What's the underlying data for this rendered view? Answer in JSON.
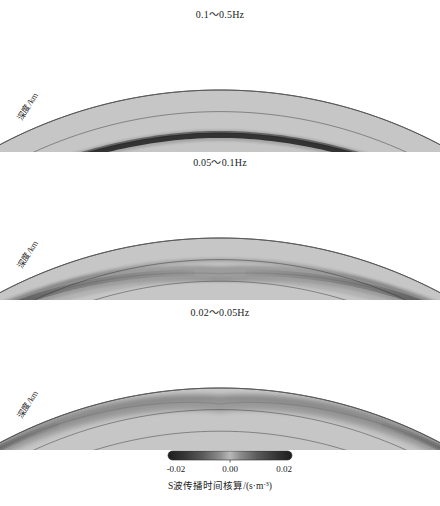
{
  "figure": {
    "background_color": "#ffffff",
    "section_fill": "#c6c6c6",
    "section_stroke": "#555555",
    "kernel_color": "#2a2a2a"
  },
  "axes": {
    "y_label": "深度/km",
    "y_ticks": [
      "0",
      "200",
      "400",
      "600",
      "800",
      "1000"
    ],
    "y_values": [
      0,
      200,
      400,
      600,
      800,
      1000
    ],
    "x_ticks": [
      "5°",
      "10°",
      "15°",
      "20°",
      "25°",
      "30°",
      "35°",
      "40°",
      "45°"
    ],
    "x_values": [
      5,
      10,
      15,
      20,
      25,
      30,
      35,
      40,
      45
    ],
    "depth_gridlines": [
      200,
      400,
      600,
      800
    ]
  },
  "panels": [
    {
      "title": "0.1～0.5Hz",
      "band_label": "0.1~0.5 Hz",
      "kernel_name": "s-wave-kernel-high-frequency",
      "description": "narrow deep U-shaped ray kernel reaching ~420 km"
    },
    {
      "title": "0.05～0.1Hz",
      "band_label": "0.05~0.1 Hz",
      "kernel_name": "s-wave-kernel-mid-frequency",
      "description": "broader V-shaped kernel with faint diffuse limbs"
    },
    {
      "title": "0.02～0.05Hz",
      "band_label": "0.02~0.05 Hz",
      "kernel_name": "s-wave-kernel-low-frequency",
      "description": "short blunt near-surface lobes at both ends"
    }
  ],
  "colorbar": {
    "label": "S波传播时间核算/(s·m",
    "label_exponent": "-3",
    "label_suffix": ")",
    "ticks": [
      "-0.02",
      "0.00",
      "0.02"
    ],
    "values": [
      -0.02,
      0.0,
      0.02
    ],
    "min": -0.02,
    "max": 0.02,
    "colormap": "grayscale-diverging"
  },
  "chart_data": {
    "type": "heatmap",
    "title": "",
    "xlabel": "",
    "ylabel": "深度/km",
    "panel_count": 3,
    "x": [
      5,
      10,
      15,
      20,
      25,
      30,
      35,
      40,
      45
    ],
    "xlim": [
      5,
      45
    ],
    "ylim": [
      0,
      1000
    ],
    "grid": true,
    "legend": "colorbar-bottom",
    "colorbar_label": "S波传播时间核算/(s·m-3)",
    "colorbar_range": [
      -0.02,
      0.02
    ],
    "series": [
      {
        "name": "0.1～0.5Hz",
        "turning_depth_km": 420,
        "kernel_width_km": 55,
        "values": [
          0,
          -0.018,
          -0.02,
          -0.019,
          -0.02,
          -0.019,
          -0.02,
          -0.018,
          0
        ]
      },
      {
        "name": "0.05～0.1Hz",
        "turning_depth_km": 330,
        "kernel_width_km": 90,
        "values": [
          0,
          -0.02,
          -0.012,
          -0.006,
          -0.004,
          -0.006,
          -0.012,
          -0.02,
          0
        ]
      },
      {
        "name": "0.02～0.05Hz",
        "turning_depth_km": 150,
        "kernel_width_km": 120,
        "values": [
          0,
          -0.02,
          -0.008,
          -0.002,
          -0.001,
          -0.002,
          -0.008,
          -0.02,
          0
        ]
      }
    ]
  }
}
